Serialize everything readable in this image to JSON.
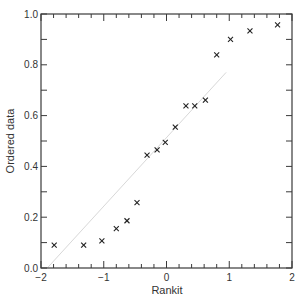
{
  "chart_data": {
    "type": "scatter",
    "title": "",
    "xlabel": "Rankit",
    "ylabel": "Ordered data",
    "xlim": [
      -2,
      2
    ],
    "ylim": [
      0.0,
      1.0
    ],
    "x_ticks": [
      -2,
      -1,
      0,
      1,
      2
    ],
    "x_tick_labels": [
      "−2",
      "−1",
      "0",
      "1",
      "2"
    ],
    "x_minor_step": 0.2,
    "y_ticks": [
      0.0,
      0.2,
      0.4,
      0.6,
      0.8,
      1.0
    ],
    "y_tick_labels": [
      "0.0",
      "0.2",
      "0.4",
      "0.6",
      "0.8",
      "1.0"
    ],
    "y_minor_step": 0.1,
    "grid": false,
    "marker": "x",
    "series": [
      {
        "name": "Ordered data vs rankit",
        "x": [
          -1.79,
          -1.32,
          -1.03,
          -0.8,
          -0.63,
          -0.47,
          -0.31,
          -0.15,
          -0.02,
          0.14,
          0.31,
          0.45,
          0.62,
          0.8,
          1.02,
          1.33,
          1.77
        ],
        "y": [
          0.09,
          0.09,
          0.107,
          0.155,
          0.186,
          0.257,
          0.444,
          0.465,
          0.495,
          0.555,
          0.638,
          0.638,
          0.661,
          0.839,
          0.9,
          0.934,
          0.957
        ]
      }
    ],
    "reference_line": {
      "description": "faint fitted line",
      "x": [
        -1.9,
        0.95
      ],
      "y": [
        0.0,
        0.77
      ]
    }
  }
}
